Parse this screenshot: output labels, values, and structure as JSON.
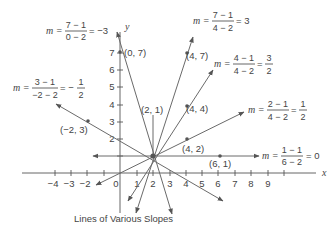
{
  "caption": "Lines of Various Slopes",
  "axes": {
    "x_label": "x",
    "y_label": "y",
    "x_ticks": [
      "−4",
      "−3",
      "−2",
      "0",
      "1",
      "2",
      "3",
      "4",
      "5",
      "6",
      "7",
      "8",
      "9"
    ],
    "y_ticks": [
      "2",
      "3",
      "4",
      "5",
      "6",
      "7"
    ]
  },
  "center_point": "(2, 1)",
  "points": [
    "(0, 7)",
    "(4, 7)",
    "(4, 4)",
    "(4, 2)",
    "(6, 1)",
    "(−2, 3)"
  ],
  "slope_labels": [
    {
      "m": "m =",
      "num": "7 − 1",
      "den": "0 − 2",
      "result": "= −3"
    },
    {
      "m": "m =",
      "num": "7 − 1",
      "den": "4 − 2",
      "result": "= 3"
    },
    {
      "m": "m =",
      "num": "4 − 1",
      "den": "4 − 2",
      "result": "=",
      "res_num": "3",
      "res_den": "2"
    },
    {
      "m": "m =",
      "num": "2 − 1",
      "den": "4 − 2",
      "result": "=",
      "res_num": "1",
      "res_den": "2"
    },
    {
      "m": "m =",
      "num": "1 − 1",
      "den": "6 − 2",
      "result": "= 0"
    },
    {
      "m": "m =",
      "num": "3 − 1",
      "den": "−2 − 2",
      "result": "= −",
      "res_num": "1",
      "res_den": "2"
    }
  ],
  "lines": [
    {
      "through": "(0, 7)",
      "slope": "-3"
    },
    {
      "through": "(4, 7)",
      "slope": "3"
    },
    {
      "through": "(4, 4)",
      "slope": "3/2"
    },
    {
      "through": "(4, 2)",
      "slope": "1/2"
    },
    {
      "through": "(6, 1)",
      "slope": "0"
    },
    {
      "through": "(-2, 3)",
      "slope": "-1/2"
    }
  ]
}
